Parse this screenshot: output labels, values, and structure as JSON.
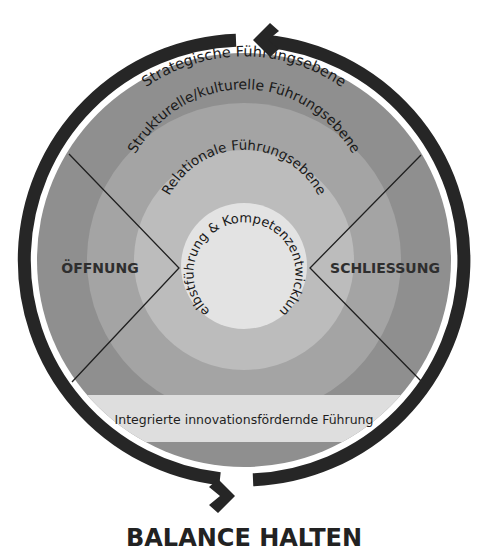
{
  "diagram": {
    "title": "BALANCE HALTEN",
    "layers": [
      {
        "id": "strategisch",
        "label": "Strategische Führungsebene",
        "color": "#8f8f8f"
      },
      {
        "id": "strukturell",
        "label": "Strukturelle/kulturelle Führungsebene",
        "color": "#a4a4a4"
      },
      {
        "id": "relational",
        "label": "Relationale Führungsebene",
        "color": "#bcbcbc"
      },
      {
        "id": "selbst",
        "label": "Selbstführung & Kompetenzentwicklung",
        "color": "#e3e3e3"
      }
    ],
    "left_label": "ÖFFNUNG",
    "right_label": "SCHLIESSUNG",
    "band_label": "Integrierte innovationsfördernde Führung",
    "band_color": "#dedede",
    "cycle_color": "#262626",
    "icons": {
      "top_arrow": "arrow-left-icon",
      "bottom_arrow": "arrow-right-icon"
    }
  }
}
